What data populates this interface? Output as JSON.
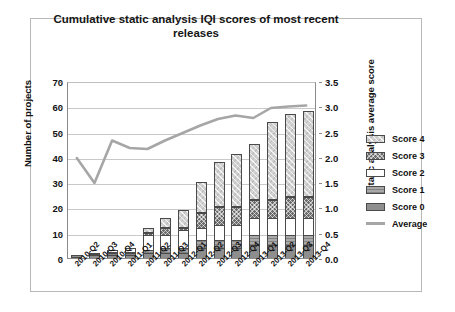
{
  "chart_data": {
    "type": "bar",
    "title": "Cumulative static analysis IQI scores of most recent releases",
    "xlabel": "",
    "ylabel": "Number of projects",
    "y2label": "Static analysis average score",
    "ylim": [
      0,
      70
    ],
    "y2lim": [
      0,
      3.5
    ],
    "yticks": [
      "0",
      "10",
      "20",
      "30",
      "40",
      "50",
      "60",
      "70"
    ],
    "y2ticks": [
      "0.0",
      "0.5",
      "1.0",
      "1.5",
      "2.0",
      "2.5",
      "3.0",
      "3.5"
    ],
    "grid": true,
    "legend_position": "right",
    "categories": [
      "2010-Q2",
      "2010-Q3",
      "2010-Q4",
      "2011-Q1",
      "2011-Q2",
      "2011-Q3",
      "2012-Q1",
      "2012-Q2",
      "2012-Q3",
      "2012-Q4",
      "2013-Q1",
      "2013-Q2",
      "2013-Q3",
      "2013-Q4"
    ],
    "stack_order": [
      "Score 0",
      "Score 1",
      "Score 2",
      "Score 3",
      "Score 4"
    ],
    "series": [
      {
        "name": "Score 0",
        "values": [
          1,
          1,
          1,
          1,
          2,
          2,
          2,
          4,
          4,
          4,
          5,
          5,
          5,
          5
        ]
      },
      {
        "name": "Score 1",
        "values": [
          0,
          0,
          1,
          1,
          1,
          2,
          2,
          3,
          3,
          3,
          4,
          4,
          4,
          4
        ]
      },
      {
        "name": "Score 2",
        "values": [
          0,
          1,
          1,
          2,
          6,
          5,
          7,
          5,
          6,
          6,
          7,
          7,
          7,
          7
        ]
      },
      {
        "name": "Score 3",
        "values": [
          0,
          0,
          0,
          0,
          1,
          3,
          1,
          6,
          7,
          7,
          7,
          7,
          8,
          8
        ]
      },
      {
        "name": "Score 4",
        "values": [
          0,
          0,
          0,
          0,
          2,
          4,
          7,
          12,
          18,
          21,
          22,
          31,
          33,
          34
        ]
      }
    ],
    "totals": [
      1,
      2,
      3,
      4,
      12,
      16,
      19,
      30,
      38,
      41,
      45,
      54,
      57,
      58
    ],
    "average_line": {
      "name": "Average",
      "values": [
        2.0,
        1.5,
        2.35,
        2.2,
        2.18,
        2.35,
        2.5,
        2.65,
        2.78,
        2.85,
        2.8,
        3.0,
        3.03,
        3.05
      ],
      "color": "#a6a6a6"
    },
    "colors": {
      "score0": "#8e8e8e",
      "score1": "#a9a9a9",
      "score2": "#ffffff",
      "score3": "#6a6a6a",
      "score4": "#d2d2d2",
      "average": "#a6a6a6",
      "grid": "#c9c9c9",
      "axis": "#8a8a8a"
    }
  },
  "legend": {
    "items": [
      {
        "label": "Score 4",
        "icon": "legend-swatch-score4"
      },
      {
        "label": "Score 3",
        "icon": "legend-swatch-score3"
      },
      {
        "label": "Score 2",
        "icon": "legend-swatch-score2"
      },
      {
        "label": "Score 1",
        "icon": "legend-swatch-score1"
      },
      {
        "label": "Score 0",
        "icon": "legend-swatch-score0"
      },
      {
        "label": "Average",
        "icon": "legend-swatch-average"
      }
    ]
  }
}
